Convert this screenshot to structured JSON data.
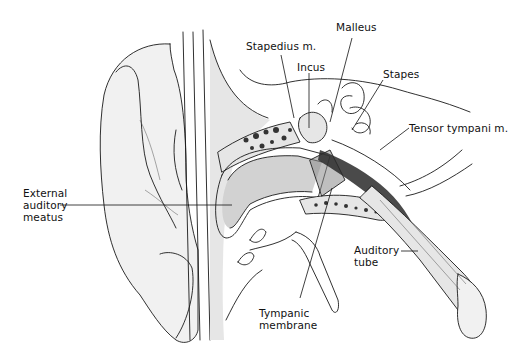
{
  "figure": {
    "background": "#ffffff",
    "ink_color": "#111111"
  },
  "labels": {
    "malleus": "Malleus",
    "stapedius": "Stapedius m.",
    "incus": "Incus",
    "stapes": "Stapes",
    "tensor_tympani": "Tensor tympani m.",
    "external_meatus": "External\nauditory\nmeatus",
    "auditory_tube": "Auditory\ntube",
    "tympanic_membrane": "Tympanic\nmembrane"
  }
}
